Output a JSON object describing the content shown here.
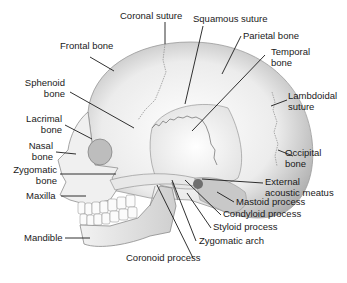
{
  "diagram": {
    "labels": {
      "coronal_suture": "Coronal suture",
      "squamous_suture": "Squamous suture",
      "parietal_bone": "Parietal bone",
      "frontal_bone": "Frontal bone",
      "temporal_bone_1": "Temporal",
      "temporal_bone_2": "bone",
      "sphenoid_bone_1": "Sphenoid",
      "sphenoid_bone_2": "bone",
      "lambdoidal_suture_1": "Lambdoidal",
      "lambdoidal_suture_2": "suture",
      "lacrimal_bone_1": "Lacrimal",
      "lacrimal_bone_2": "bone",
      "nasal_bone_1": "Nasal",
      "nasal_bone_2": "bone",
      "occipital_bone_1": "Occipital",
      "occipital_bone_2": "bone",
      "zygomatic_bone_1": "Zygomatic",
      "zygomatic_bone_2": "bone",
      "external_acoustic_meatus_1": "External",
      "external_acoustic_meatus_2": "acoustic meatus",
      "maxilla": "Maxilla",
      "mastoid_process": "Mastoid process",
      "condyloid_process": "Condyloid process",
      "styloid_process": "Styloid process",
      "mandible": "Mandible",
      "zygomatic_arch": "Zygomatic arch",
      "coronoid_process": "Coronoid process"
    },
    "colors": {
      "bone_light": "#f4f4f4",
      "bone_shade": "#b8b8b8",
      "leader_line": "#1a1a1a",
      "text": "#1a1a1a"
    }
  }
}
